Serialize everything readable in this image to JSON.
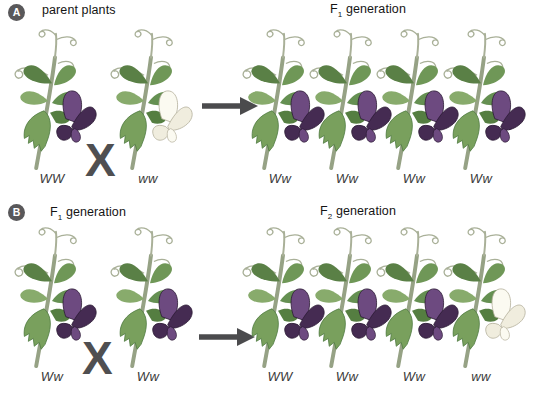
{
  "figure": {
    "cross_symbol": "X"
  },
  "colors": {
    "flower_purple": "#452b52",
    "flower_white": "#f0edde",
    "leaf_green": "#6f9757",
    "stem_green": "#96a285",
    "arrow_gray": "#4b4b4d",
    "badge_gray": "#59585a",
    "text_black": "#1c1c1c"
  },
  "panel_a": {
    "badge": "A",
    "left_heading": {
      "pre": "parent plants",
      "sub": "",
      "post": ""
    },
    "right_heading": {
      "pre": "F",
      "sub": "1",
      "post": " generation"
    },
    "cross": "X",
    "parents": [
      {
        "genotype": "WW",
        "flower": "purple"
      },
      {
        "genotype": "ww",
        "flower": "white"
      }
    ],
    "offspring": [
      {
        "genotype": "Ww",
        "flower": "purple"
      },
      {
        "genotype": "Ww",
        "flower": "purple"
      },
      {
        "genotype": "Ww",
        "flower": "purple"
      },
      {
        "genotype": "Ww",
        "flower": "purple"
      }
    ]
  },
  "panel_b": {
    "badge": "B",
    "left_heading": {
      "pre": "F",
      "sub": "1",
      "post": " generation"
    },
    "right_heading": {
      "pre": "F",
      "sub": "2",
      "post": " generation"
    },
    "cross": "X",
    "parents": [
      {
        "genotype": "Ww",
        "flower": "purple"
      },
      {
        "genotype": "Ww",
        "flower": "purple"
      }
    ],
    "offspring": [
      {
        "genotype": "WW",
        "flower": "purple"
      },
      {
        "genotype": "Ww",
        "flower": "purple"
      },
      {
        "genotype": "Ww",
        "flower": "purple"
      },
      {
        "genotype": "ww",
        "flower": "white"
      }
    ]
  }
}
